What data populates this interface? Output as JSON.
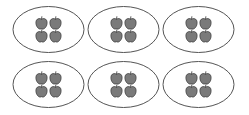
{
  "diagram": {
    "groups": [
      {
        "row": 0,
        "col": 0,
        "apples": 4
      },
      {
        "row": 0,
        "col": 1,
        "apples": 4
      },
      {
        "row": 0,
        "col": 2,
        "apples": 4
      },
      {
        "row": 1,
        "col": 0,
        "apples": 4
      },
      {
        "row": 1,
        "col": 1,
        "apples": 4
      },
      {
        "row": 1,
        "col": 2,
        "apples": 4
      }
    ],
    "total_groups": 6,
    "apples_per_group": 4,
    "total_apples": 24
  },
  "colors": {
    "apple_fill": "#7a7a7a",
    "apple_stroke": "#333333",
    "oval_stroke": "#555555",
    "background": "#ffffff"
  },
  "icons": {
    "apple": "apple-icon"
  }
}
